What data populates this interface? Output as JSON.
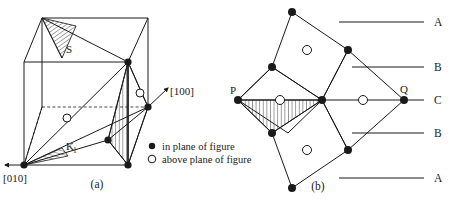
{
  "figure": {
    "panels": [
      {
        "id": "a",
        "caption": "(a)",
        "description": "cubic unit cell with twinning planes",
        "axis_labels": [
          {
            "name": "axis-010",
            "text": "[010]",
            "direction": "left"
          },
          {
            "name": "axis-100",
            "text": "[100]",
            "direction": "up-right"
          }
        ],
        "plane_labels": [
          {
            "name": "plane-S",
            "text": "S"
          },
          {
            "name": "plane-K1",
            "text": "K",
            "subscript": "1"
          }
        ]
      },
      {
        "id": "b",
        "caption": "(b)",
        "description": "projected atomic stacking across the twin boundary",
        "vertex_labels": [
          {
            "name": "vertex-P",
            "text": "P"
          },
          {
            "name": "vertex-Q",
            "text": "Q"
          }
        ],
        "stacking_rows": [
          {
            "label": "A",
            "y": 22
          },
          {
            "label": "B",
            "y": 67
          },
          {
            "label": "C",
            "y": 100
          },
          {
            "label": "B",
            "y": 133
          },
          {
            "label": "A",
            "y": 178
          }
        ]
      }
    ],
    "legend": {
      "name": "symbol-legend",
      "entries": [
        {
          "symbol": "filled-circle",
          "label": "in plane of figure"
        },
        {
          "symbol": "open-circle",
          "label": "above plane of figure"
        }
      ]
    },
    "colors": {
      "stroke": "#1a1a1a",
      "fill_node": "#1a1a1a",
      "background": "#ffffff",
      "hatch": "#1a1a1a"
    }
  }
}
